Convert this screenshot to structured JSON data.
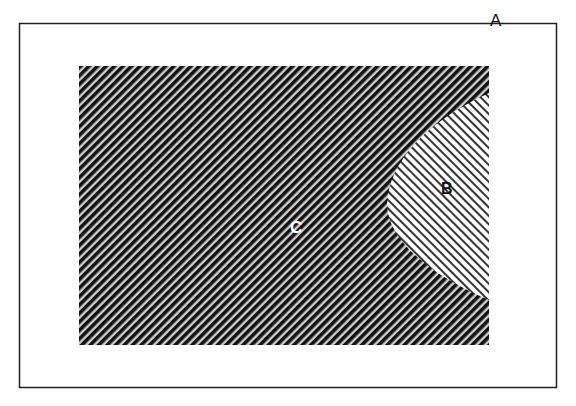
{
  "diagram": {
    "type": "venn-style region diagram",
    "colors": {
      "background": "#ffffff",
      "frame_border": "#222222",
      "region_c_hatch_dark": "#111111",
      "region_c_hatch_light": "#cfcfcf",
      "region_b_hatch_dark": "#333333",
      "region_b_hatch_light": "#ffffff"
    },
    "regions": {
      "a": {
        "label": "A",
        "description": "Outer universal set (white rectangle with thin border)"
      },
      "c": {
        "label": "C",
        "description": "Inner rectangle with dense dark diagonal hatching"
      },
      "b": {
        "label": "B",
        "description": "Curved region on the right edge of C with light diagonal hatching in opposite direction"
      }
    }
  }
}
